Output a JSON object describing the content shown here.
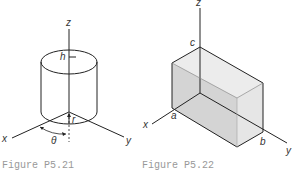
{
  "figures": [
    {
      "id": "P5.21",
      "caption": "Figure P5.21",
      "shape": "cylinder",
      "labels": {
        "z": "z",
        "x": "x",
        "y": "y",
        "h": "h",
        "r": "r",
        "theta": "θ"
      }
    },
    {
      "id": "P5.22",
      "caption": "Figure P5.22",
      "shape": "rectangular box",
      "labels": {
        "z": "z",
        "x": "x",
        "y": "y",
        "a": "a",
        "b": "b",
        "c": "c"
      }
    }
  ],
  "colors": {
    "line": "#222222",
    "box_fill": "#d9d9d9",
    "box_face_light": "#ececec",
    "caption": "#999999"
  }
}
